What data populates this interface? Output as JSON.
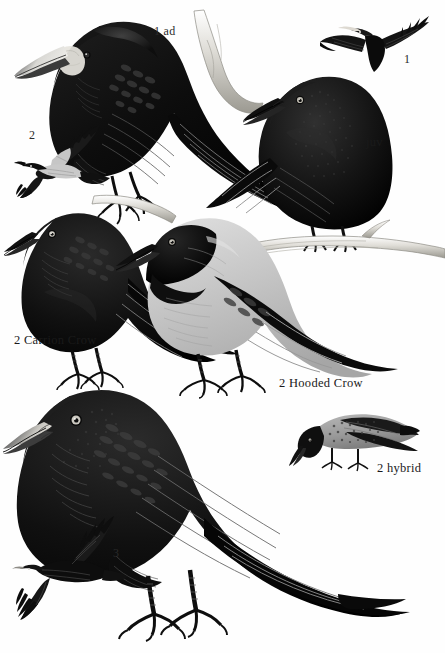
{
  "plate": {
    "title": "Crow plate — Rook, Carrion Crow, Hooded Crow",
    "background_color": "#fefefe",
    "ink_color": "#111111",
    "grey_color": "#c6c6c6",
    "pale_color": "#e8e8e4",
    "width": 445,
    "height": 653
  },
  "labels": [
    {
      "id": "rook-ad",
      "text": "1 ad",
      "x": 154,
      "y": 24,
      "kind": "caption"
    },
    {
      "id": "rook-flight",
      "text": "1",
      "x": 404,
      "y": 52,
      "kind": "number"
    },
    {
      "id": "crow-juv",
      "text": "1 juv",
      "x": 356,
      "y": 135,
      "kind": "caption"
    },
    {
      "id": "hooded-flight",
      "text": "2",
      "x": 29,
      "y": 128,
      "kind": "number"
    },
    {
      "id": "carrion-crow",
      "text": "2 Carrion Crow",
      "x": 14,
      "y": 333,
      "kind": "caption"
    },
    {
      "id": "hooded-crow",
      "text": "2 Hooded Crow",
      "x": 279,
      "y": 376,
      "kind": "caption"
    },
    {
      "id": "hybrid",
      "text": "2 hybrid",
      "x": 377,
      "y": 461,
      "kind": "caption"
    },
    {
      "id": "rook-juv",
      "text": "3",
      "x": 113,
      "y": 546,
      "kind": "number"
    }
  ],
  "figures": [
    {
      "id": "rook-adult-perched",
      "name": "rook-adult-perched",
      "caption_ref": "rook-ad"
    },
    {
      "id": "rook-flight",
      "name": "rook-in-flight",
      "caption_ref": "rook-flight"
    },
    {
      "id": "crow-juvenile",
      "name": "carrion-crow-juvenile",
      "caption_ref": "crow-juv"
    },
    {
      "id": "hooded-flight",
      "name": "hooded-crow-in-flight",
      "caption_ref": "hooded-flight"
    },
    {
      "id": "carrion-crow-standing",
      "name": "carrion-crow-adult",
      "caption_ref": "carrion-crow"
    },
    {
      "id": "hooded-crow-standing",
      "name": "hooded-crow-adult",
      "caption_ref": "hooded-crow"
    },
    {
      "id": "hybrid-crow",
      "name": "hybrid-crow",
      "caption_ref": "hybrid"
    },
    {
      "id": "rook-juvenile",
      "name": "rook-juvenile-standing",
      "caption_ref": "rook-juv"
    },
    {
      "id": "rook-juv-flight",
      "name": "rook-juvenile-flight",
      "caption_ref": "rook-juv"
    }
  ]
}
